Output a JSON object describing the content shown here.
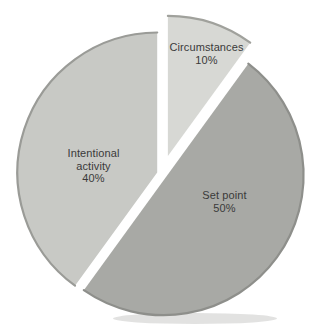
{
  "figure": {
    "background_color": "#ffffff",
    "label_text_color": "#3a3a3a"
  },
  "chart_data": {
    "type": "pie",
    "title": "",
    "unit": "percent",
    "start_angle_deg": 0,
    "direction": "clockwise",
    "legend": "none",
    "slices": [
      {
        "label": "Circumstances",
        "value": 10,
        "pct_label": "10%",
        "label_lines": [
          "Circumstances"
        ],
        "color": "#d7d8d4",
        "edge_color": "#a0a19c",
        "explode_px": 19
      },
      {
        "label": "Set point",
        "value": 50,
        "pct_label": "50%",
        "label_lines": [
          "Set point"
        ],
        "color": "#a8a9a5",
        "edge_color": "#8e8f8b",
        "explode_px": 5
      },
      {
        "label": "Intentional activity",
        "value": 40,
        "pct_label": "40%",
        "label_lines": [
          "Intentional",
          "activity"
        ],
        "color": "#c8c9c5",
        "edge_color": "#9a9b97",
        "explode_px": 5
      }
    ],
    "layout": {
      "cx": 162,
      "cy": 174,
      "radius": 140,
      "gap_style": "exploded-white-gaps",
      "label_color": "#3a3a3a"
    }
  }
}
